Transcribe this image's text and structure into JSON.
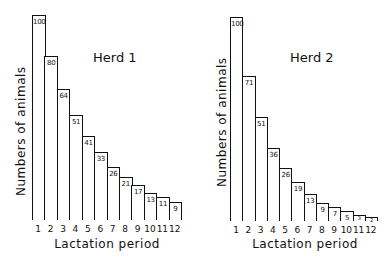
{
  "chart_data": [
    {
      "type": "bar",
      "title": "Herd 1",
      "xlabel": "Lactation period",
      "ylabel": "Numbers of animals",
      "categories": [
        "1",
        "2",
        "3",
        "4",
        "5",
        "6",
        "7",
        "8",
        "9",
        "10",
        "11",
        "12"
      ],
      "values": [
        100,
        80,
        64,
        51,
        41,
        33,
        26,
        21,
        17,
        13,
        11,
        9
      ],
      "ylim": [
        0,
        100
      ],
      "grid": false,
      "data_labels": true
    },
    {
      "type": "bar",
      "title": "Herd 2",
      "xlabel": "Lactation period",
      "ylabel": "Numbers of animals",
      "categories": [
        "1",
        "2",
        "3",
        "4",
        "5",
        "6",
        "7",
        "8",
        "9",
        "10",
        "11",
        "12"
      ],
      "values": [
        100,
        71,
        51,
        36,
        26,
        19,
        13,
        9,
        7,
        5,
        3,
        2
      ],
      "ylim": [
        0,
        100
      ],
      "grid": false,
      "data_labels": true
    }
  ],
  "charts": [
    {
      "title": "Herd 1",
      "xlabel": "Lactation period",
      "ylabel": "Numbers of animals",
      "bars": [
        {
          "cat": "1",
          "val": 100,
          "label": "100"
        },
        {
          "cat": "2",
          "val": 80,
          "label": "80"
        },
        {
          "cat": "3",
          "val": 64,
          "label": "64"
        },
        {
          "cat": "4",
          "val": 51,
          "label": "51"
        },
        {
          "cat": "5",
          "val": 41,
          "label": "41"
        },
        {
          "cat": "6",
          "val": 33,
          "label": "33"
        },
        {
          "cat": "7",
          "val": 26,
          "label": "26"
        },
        {
          "cat": "8",
          "val": 21,
          "label": "21"
        },
        {
          "cat": "9",
          "val": 17,
          "label": "17"
        },
        {
          "cat": "10",
          "val": 13,
          "label": "13"
        },
        {
          "cat": "11",
          "val": 11,
          "label": "11"
        },
        {
          "cat": "12",
          "val": 9,
          "label": "9"
        }
      ]
    },
    {
      "title": "Herd 2",
      "xlabel": "Lactation period",
      "ylabel": "Numbers of animals",
      "bars": [
        {
          "cat": "1",
          "val": 100,
          "label": "100"
        },
        {
          "cat": "2",
          "val": 71,
          "label": "71"
        },
        {
          "cat": "3",
          "val": 51,
          "label": "51"
        },
        {
          "cat": "4",
          "val": 36,
          "label": "36"
        },
        {
          "cat": "5",
          "val": 26,
          "label": "26"
        },
        {
          "cat": "6",
          "val": 19,
          "label": "19"
        },
        {
          "cat": "7",
          "val": 13,
          "label": "13"
        },
        {
          "cat": "8",
          "val": 9,
          "label": "9"
        },
        {
          "cat": "9",
          "val": 7,
          "label": "7"
        },
        {
          "cat": "10",
          "val": 5,
          "label": "5"
        },
        {
          "cat": "11",
          "val": 3,
          "label": "3"
        },
        {
          "cat": "12",
          "val": 2,
          "label": "2"
        }
      ]
    }
  ]
}
